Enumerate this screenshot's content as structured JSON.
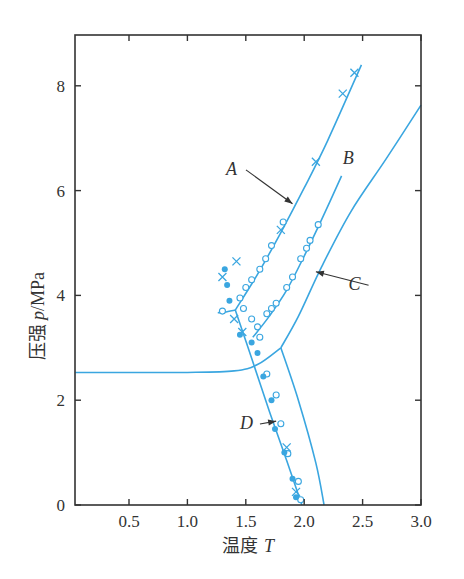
{
  "chart_data": {
    "type": "line",
    "title": "",
    "xlabel": "温度 T",
    "xlabel_prefix": "温度",
    "xlabel_var": "T",
    "ylabel": "压强 p/MPa",
    "ylabel_prefix": "压强",
    "ylabel_var": "p",
    "ylabel_unit": "/MPa",
    "xlim": [
      0.04,
      3.0
    ],
    "ylim": [
      0,
      9
    ],
    "x_ticks": [
      0.5,
      1.0,
      1.5,
      2.0,
      2.5,
      3.0
    ],
    "x_tick_labels": [
      "0.5",
      "1.0",
      "1.5",
      "2.0",
      "2.5",
      "3.0"
    ],
    "y_ticks": [
      0,
      2,
      4,
      6,
      8
    ],
    "y_tick_labels": [
      "0",
      "2",
      "4",
      "6",
      "8"
    ],
    "grid": false,
    "line_color": "#3aa6e0",
    "series": [
      {
        "name": "A",
        "label": "A",
        "x": [
          1.41,
          1.6,
          1.8,
          2.0,
          2.2,
          2.49
        ],
        "y": [
          3.72,
          4.4,
          5.2,
          6.05,
          6.95,
          8.4
        ]
      },
      {
        "name": "A-kink",
        "label": "",
        "x": [
          1.26,
          1.32,
          1.41
        ],
        "y": [
          3.67,
          3.68,
          3.72
        ]
      },
      {
        "name": "B",
        "label": "B",
        "x": [
          1.56,
          1.7,
          1.85,
          2.0,
          2.15,
          2.32
        ],
        "y": [
          3.2,
          3.6,
          4.1,
          4.75,
          5.45,
          6.28
        ]
      },
      {
        "name": "C",
        "label": "C",
        "x": [
          1.8,
          1.95,
          2.15,
          2.4,
          2.7,
          3.0
        ],
        "y": [
          3.0,
          3.6,
          4.55,
          5.6,
          6.6,
          7.63
        ]
      },
      {
        "name": "horizontal",
        "label": "",
        "x": [
          0.04,
          0.5,
          1.0,
          1.4,
          1.6,
          1.8
        ],
        "y": [
          2.53,
          2.53,
          2.53,
          2.56,
          2.68,
          3.0
        ]
      },
      {
        "name": "D",
        "label": "D",
        "x": [
          1.41,
          1.55,
          1.7,
          1.85,
          1.98
        ],
        "y": [
          3.72,
          2.8,
          1.8,
          0.85,
          0.0
        ]
      },
      {
        "name": "right-boundary",
        "label": "",
        "x": [
          1.8,
          1.95,
          2.1,
          2.17
        ],
        "y": [
          3.0,
          2.0,
          0.8,
          0.0
        ]
      }
    ],
    "markers": {
      "open_circles_A": [
        [
          1.3,
          3.7
        ],
        [
          1.45,
          3.95
        ],
        [
          1.5,
          4.15
        ],
        [
          1.55,
          4.3
        ],
        [
          1.62,
          4.5
        ],
        [
          1.67,
          4.7
        ],
        [
          1.72,
          4.95
        ],
        [
          1.82,
          5.4
        ]
      ],
      "open_circles_B": [
        [
          1.6,
          3.4
        ],
        [
          1.68,
          3.65
        ],
        [
          1.72,
          3.75
        ],
        [
          1.76,
          3.85
        ],
        [
          1.85,
          4.15
        ],
        [
          1.9,
          4.35
        ],
        [
          1.97,
          4.7
        ],
        [
          2.02,
          4.9
        ],
        [
          2.05,
          5.05
        ],
        [
          2.12,
          5.35
        ]
      ],
      "crosses": [
        [
          1.3,
          4.35
        ],
        [
          1.42,
          4.65
        ],
        [
          1.4,
          3.55
        ],
        [
          1.47,
          3.3
        ],
        [
          1.8,
          5.25
        ],
        [
          2.1,
          6.55
        ],
        [
          2.33,
          7.85
        ],
        [
          2.43,
          8.25
        ],
        [
          1.85,
          1.1
        ],
        [
          1.93,
          0.25
        ]
      ],
      "filled_dots": [
        [
          1.32,
          4.5
        ],
        [
          1.34,
          4.2
        ],
        [
          1.36,
          3.9
        ],
        [
          1.45,
          3.25
        ],
        [
          1.55,
          3.1
        ],
        [
          1.6,
          2.9
        ],
        [
          1.65,
          2.45
        ],
        [
          1.72,
          2.0
        ],
        [
          1.75,
          1.45
        ],
        [
          1.83,
          1.0
        ],
        [
          1.9,
          0.5
        ],
        [
          1.93,
          0.15
        ]
      ],
      "open_circles_D": [
        [
          1.48,
          3.75
        ],
        [
          1.55,
          3.55
        ],
        [
          1.62,
          3.2
        ],
        [
          1.68,
          2.5
        ],
        [
          1.76,
          2.1
        ],
        [
          1.8,
          1.55
        ],
        [
          1.86,
          0.98
        ],
        [
          1.95,
          0.45
        ],
        [
          1.97,
          0.1
        ]
      ]
    },
    "annotations": [
      {
        "text": "A",
        "x": 1.33,
        "y": 6.3,
        "arrow_to": [
          1.9,
          5.75
        ]
      },
      {
        "text": "B",
        "x": 2.33,
        "y": 6.5
      },
      {
        "text": "C",
        "x": 2.38,
        "y": 4.1,
        "arrow_to": [
          2.1,
          4.45
        ]
      },
      {
        "text": "D",
        "x": 1.45,
        "y": 1.45,
        "arrow_to": [
          1.76,
          1.6
        ]
      }
    ]
  }
}
